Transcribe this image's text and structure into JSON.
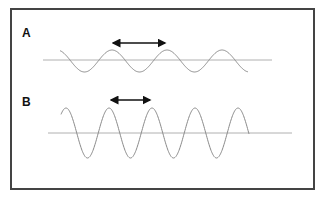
{
  "panels": [
    {
      "label": "A",
      "description": "Low-amplitude wave, longer wavelength",
      "wavelength_px": 55,
      "amplitude_px": 11
    },
    {
      "label": "B",
      "description": "High-amplitude wave, shorter wavelength",
      "wavelength_px": 43,
      "amplitude_px": 25
    }
  ],
  "colors": {
    "wave": "#8a8a8a",
    "axis": "#b0b0b0",
    "arrow": "#111111",
    "border": "#444444"
  }
}
